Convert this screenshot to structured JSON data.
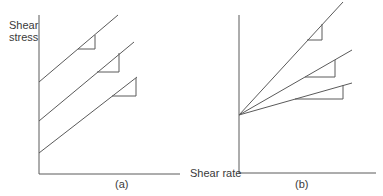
{
  "diagram": {
    "y_axis_label_line1": "Shear",
    "y_axis_label_line2": "stress",
    "x_axis_label": "Shear rate",
    "panel_a": {
      "caption": "(a)",
      "description": "Three parallel straight lines with different positive y-intercepts (equal slopes)",
      "lines": [
        {
          "x1": 39,
          "y1": 82,
          "x2": 118,
          "y2": 15,
          "triangle": {
            "hx1": 78,
            "hx2": 95,
            "hy": 49,
            "vy1": 35
          }
        },
        {
          "x1": 39,
          "y1": 121,
          "x2": 134,
          "y2": 42,
          "triangle": {
            "hx1": 97,
            "hx2": 119,
            "hy": 72,
            "vy1": 53
          }
        },
        {
          "x1": 39,
          "y1": 153,
          "x2": 137,
          "y2": 77,
          "triangle": {
            "hx1": 112,
            "hx2": 136,
            "hy": 96,
            "vy1": 78
          }
        }
      ]
    },
    "panel_b": {
      "caption": "(b)",
      "description": "Three straight lines from a common y-intercept with different slopes",
      "origin": {
        "x": 239,
        "y": 115
      },
      "lines": [
        {
          "x2": 343,
          "y2": 2,
          "triangle": {
            "hx1": 307,
            "hx2": 322,
            "hy": 40,
            "vy1": 24
          }
        },
        {
          "x2": 352,
          "y2": 50,
          "triangle": {
            "hx1": 305,
            "hx2": 335,
            "hy": 77,
            "vy1": 60
          }
        },
        {
          "x2": 352,
          "y2": 83,
          "triangle": {
            "hx1": 295,
            "hx2": 343,
            "hy": 99,
            "vy1": 85
          }
        }
      ]
    },
    "colors": {
      "line": "#555555",
      "axis": "#555555",
      "text": "#3a3a3a"
    }
  }
}
